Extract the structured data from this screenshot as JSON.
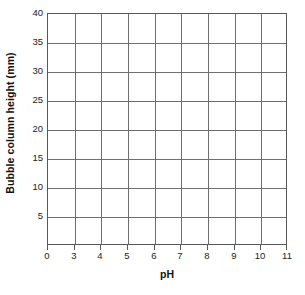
{
  "chart_data": {
    "type": "line",
    "title": "",
    "subtitle": "",
    "xlabel": "pH",
    "ylabel": "Bubble column height (mm)",
    "x": [],
    "series": [],
    "values": [],
    "categories": [],
    "xlim": [
      0,
      11
    ],
    "ylim": [
      0,
      40
    ],
    "x_tick_labels": [
      "0",
      "3",
      "4",
      "5",
      "6",
      "7",
      "8",
      "9",
      "10",
      "11"
    ],
    "x_tick_values": [
      0,
      3,
      4,
      5,
      6,
      7,
      8,
      9,
      10,
      11
    ],
    "y_tick_labels": [
      "40",
      "35",
      "30",
      "25",
      "20",
      "15",
      "10",
      "5"
    ],
    "y_tick_values": [
      40,
      35,
      30,
      25,
      20,
      15,
      10,
      5
    ],
    "grid": true,
    "grid_color": "#6e6e70",
    "frame_color": "#58585a",
    "background": "#ffffff",
    "legend": null,
    "legend_position": "none",
    "annotations": [],
    "note": "Empty grid; no data plotted"
  },
  "axes": {
    "x_title": "pH",
    "y_title": "Bubble column height (mm)"
  }
}
